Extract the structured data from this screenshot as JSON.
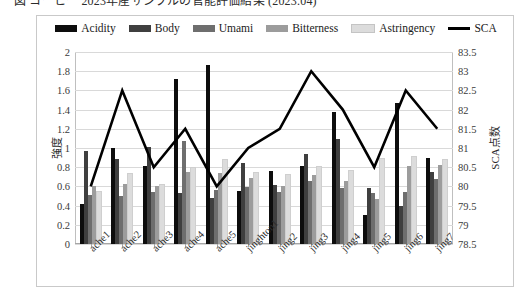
{
  "caption": {
    "text": "図 コーヒー 2023年産サンプルの官能評価結果 (2023.04)"
  },
  "chart_data": {
    "type": "bar",
    "title": "",
    "xlabel": "",
    "ylabel": "強度",
    "ylabel_secondary": "SCA点数",
    "ylim": [
      0,
      2
    ],
    "ylim_secondary": [
      78.5,
      83.5
    ],
    "yticks": [
      "2",
      "1.8",
      "1.6",
      "1.4",
      "1.2",
      "1",
      "0.8",
      "0.6",
      "0.4",
      "0.2",
      "0"
    ],
    "yticks_secondary": [
      "83.5",
      "83",
      "82.5",
      "82",
      "81.5",
      "81",
      "80.5",
      "80",
      "79.5",
      "79",
      "78.5"
    ],
    "grid": true,
    "legend_position": "top-center",
    "categories": [
      "ache1",
      "ache2",
      "ache3",
      "ache4",
      "ache5",
      "jinghton1",
      "jing2",
      "jing3",
      "jing4",
      "jing5",
      "jing6",
      "jing7"
    ],
    "series": [
      {
        "name": "Acidity",
        "color": "#0d0d0d",
        "axis": "left",
        "type": "bar",
        "values": [
          0.42,
          1.0,
          0.81,
          1.72,
          1.86,
          0.55,
          0.76,
          0.81,
          1.38,
          0.3,
          1.47,
          0.9
        ]
      },
      {
        "name": "Body",
        "color": "#3f3f3f",
        "axis": "left",
        "type": "bar",
        "values": [
          0.97,
          0.89,
          1.01,
          0.53,
          0.48,
          0.84,
          0.61,
          0.94,
          1.09,
          0.58,
          0.4,
          0.75
        ]
      },
      {
        "name": "Umami",
        "color": "#6e6e6e",
        "axis": "left",
        "type": "bar",
        "values": [
          0.51,
          0.5,
          0.54,
          1.07,
          0.56,
          0.59,
          0.54,
          0.66,
          0.58,
          0.53,
          0.54,
          0.68
        ]
      },
      {
        "name": "Bitterness",
        "color": "#9c9c9c",
        "axis": "left",
        "type": "bar",
        "values": [
          0.6,
          0.63,
          0.6,
          0.75,
          0.74,
          0.69,
          0.6,
          0.72,
          0.66,
          0.47,
          0.81,
          0.82
        ]
      },
      {
        "name": "Astringency",
        "color": "#dcdcdc",
        "axis": "left",
        "type": "bar",
        "values": [
          0.53,
          0.72,
          0.6,
          0.78,
          0.86,
          0.73,
          0.71,
          0.79,
          0.75,
          0.88,
          0.9,
          0.86
        ]
      },
      {
        "name": "SCA",
        "color": "#000000",
        "axis": "right",
        "type": "line",
        "values": [
          80.0,
          82.5,
          80.5,
          81.5,
          80.0,
          81.0,
          81.5,
          83.0,
          82.0,
          80.5,
          82.5,
          81.5
        ]
      }
    ]
  }
}
